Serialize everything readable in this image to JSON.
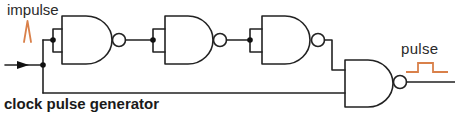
{
  "diagram": {
    "type": "logic-circuit",
    "caption": "clock pulse generator",
    "labels": {
      "input": "impulse",
      "output": "pulse"
    },
    "colors": {
      "wire": "#222222",
      "signal": "#d9804a",
      "text": "#2a2a2a"
    },
    "components": [
      {
        "id": "nand-1",
        "type": "NAND",
        "inputs": "tied (inverter)"
      },
      {
        "id": "nand-2",
        "type": "NAND",
        "inputs": "tied (inverter)"
      },
      {
        "id": "nand-3",
        "type": "NAND",
        "inputs": "tied (inverter)"
      },
      {
        "id": "nand-4",
        "type": "NAND",
        "inputs": "inverter chain output + direct input"
      }
    ],
    "signals": [
      {
        "name": "impulse",
        "waveform": "spike",
        "position": "input"
      },
      {
        "name": "pulse",
        "waveform": "square pulse",
        "position": "output"
      }
    ]
  }
}
